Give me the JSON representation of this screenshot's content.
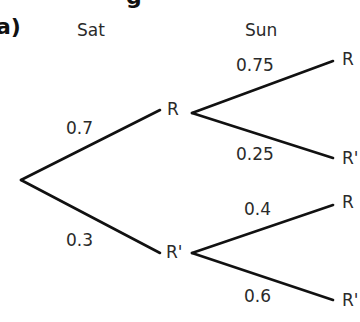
{
  "heading_fragment": "g",
  "part_label": "a)",
  "columns": {
    "first": "Sat",
    "second": "Sun"
  },
  "tree": {
    "first_level": [
      {
        "outcome": "R",
        "probability": "0.7"
      },
      {
        "outcome": "R'",
        "probability": "0.3"
      }
    ],
    "second_level": {
      "after_R": [
        {
          "outcome": "R",
          "probability": "0.75"
        },
        {
          "outcome": "R'",
          "probability": "0.25"
        }
      ],
      "after_R_prime": [
        {
          "outcome": "R",
          "probability": "0.4"
        },
        {
          "outcome": "R'",
          "probability": "0.6"
        }
      ]
    }
  }
}
